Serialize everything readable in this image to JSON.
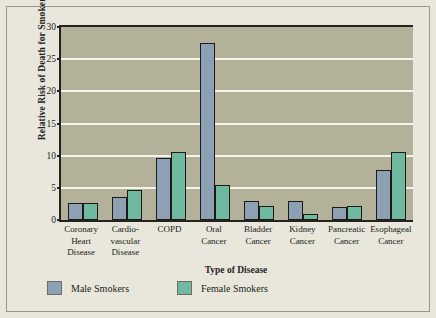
{
  "chart_data": {
    "type": "bar",
    "title": "",
    "xlabel": "Type of Disease",
    "ylabel": "Relative Risk of Death for Smokers",
    "ylim": [
      0,
      30
    ],
    "yticks": [
      0,
      5,
      10,
      15,
      20,
      25,
      30
    ],
    "grid": true,
    "legend_position": "bottom-left",
    "categories": [
      "Coronary Heart Disease",
      "Cardio-vascular Disease",
      "COPD",
      "Oral Cancer",
      "Bladder Cancer",
      "Kidney Cancer",
      "Pancreatic Cancer",
      "Esophageal Cancer"
    ],
    "category_lines": [
      [
        "Coronary",
        "Heart",
        "Disease"
      ],
      [
        "Cardio-",
        "vascular",
        "Disease"
      ],
      [
        "COPD"
      ],
      [
        "Oral",
        "Cancer"
      ],
      [
        "Bladder",
        "Cancer"
      ],
      [
        "Kidney",
        "Cancer"
      ],
      [
        "Pancreatic",
        "Cancer"
      ],
      [
        "Esophageal",
        "Cancer"
      ]
    ],
    "series": [
      {
        "name": "Male Smokers",
        "color": "#8ea1b4",
        "values": [
          2.6,
          3.5,
          9.7,
          27.5,
          2.9,
          3.0,
          2.0,
          7.7
        ]
      },
      {
        "name": "Female Smokers",
        "color": "#6fb9a0",
        "values": [
          2.6,
          4.6,
          10.5,
          5.5,
          2.2,
          1.0,
          2.2,
          10.5
        ]
      }
    ]
  },
  "colors": {
    "page_background": "#e9e7dc",
    "plot_background": "#b4b19a",
    "gridline": "#f4f3ec",
    "axis": "#25231d",
    "male": "#8ea1b4",
    "female": "#6fb9a0",
    "text": "#201e18"
  },
  "legend": {
    "items": [
      {
        "label": "Male Smokers",
        "color": "#8ea1b4"
      },
      {
        "label": "Female Smokers",
        "color": "#6fb9a0"
      }
    ]
  }
}
